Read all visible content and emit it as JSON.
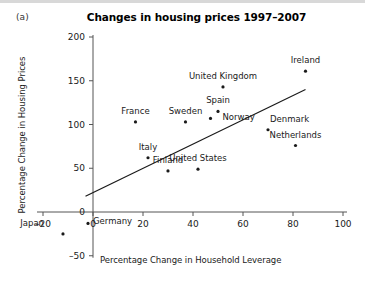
{
  "figure": {
    "panel_letter": "(a)",
    "title": "Changes in housing prices 1997–2007"
  },
  "chart_data": {
    "type": "scatter",
    "title": "Changes in housing prices 1997–2007",
    "xlabel": "Percentage Change in Household Leverage",
    "ylabel": "Percentage Change in Housing Prices",
    "xlim": [
      -20,
      100
    ],
    "ylim": [
      -50,
      200
    ],
    "xticks": [
      -20,
      0,
      20,
      40,
      60,
      80,
      100
    ],
    "yticks": [
      -50,
      0,
      50,
      100,
      150,
      200
    ],
    "xtick_labels": [
      "–20",
      "0",
      "20",
      "40",
      "60",
      "80",
      "100"
    ],
    "ytick_labels": [
      "–50",
      "0",
      "50",
      "100",
      "150",
      "200"
    ],
    "grid": false,
    "legend": "none",
    "points": [
      {
        "label": "Japan",
        "x": -12,
        "y": -25,
        "label_dx": -19,
        "label_dy": -8
      },
      {
        "label": "Germany",
        "x": -2,
        "y": -13,
        "label_dx": 5,
        "label_dy": 1
      },
      {
        "label": "France",
        "x": 17,
        "y": 103,
        "label_dx": 0,
        "label_dy": -8
      },
      {
        "label": "Italy",
        "x": 22,
        "y": 62,
        "label_dx": 0,
        "label_dy": -8
      },
      {
        "label": "Finland",
        "x": 30,
        "y": 47,
        "label_dx": 0,
        "label_dy": -8
      },
      {
        "label": "Sweden",
        "x": 37,
        "y": 103,
        "label_dx": 0,
        "label_dy": -8
      },
      {
        "label": "United States",
        "x": 42,
        "y": 49,
        "label_dx": 0,
        "label_dy": -8
      },
      {
        "label": "Norway",
        "x": 47,
        "y": 107,
        "label_dx": 12,
        "label_dy": 2
      },
      {
        "label": "Spain",
        "x": 50,
        "y": 115,
        "label_dx": 0,
        "label_dy": -8
      },
      {
        "label": "United Kingdom",
        "x": 52,
        "y": 143,
        "label_dx": 0,
        "label_dy": -8
      },
      {
        "label": "Denmark",
        "x": 70,
        "y": 94,
        "label_dx": 2,
        "label_dy": -8
      },
      {
        "label": "Netherlands",
        "x": 81,
        "y": 76,
        "label_dx": 0,
        "label_dy": -8
      },
      {
        "label": "Ireland",
        "x": 85,
        "y": 161,
        "label_dx": 0,
        "label_dy": -8
      }
    ],
    "trendline": {
      "x_start": -3,
      "y_start": 18,
      "x_end": 85,
      "y_end": 140
    }
  },
  "colors": {
    "point": "#1a1a1a",
    "trendline": "#1a1a1a",
    "axis": "#555555",
    "text": "#1a1a1a",
    "background": "#ffffff"
  }
}
